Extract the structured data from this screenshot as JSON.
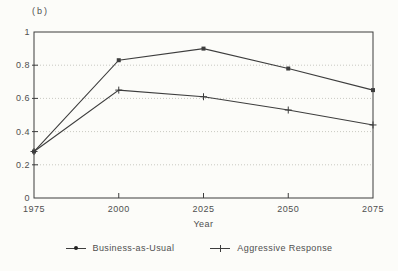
{
  "figure_label": "(b)",
  "chart_data": {
    "type": "line",
    "x": [
      1975,
      2000,
      2025,
      2050,
      2075
    ],
    "series": [
      {
        "name": "Business-as-Usual",
        "marker": "square",
        "values": [
          0.28,
          0.83,
          0.9,
          0.78,
          0.65
        ]
      },
      {
        "name": "Aggressive Response",
        "marker": "plus",
        "values": [
          0.28,
          0.65,
          0.61,
          0.53,
          0.44
        ]
      }
    ],
    "title": "",
    "xlabel": "Year",
    "ylabel": "",
    "xlim": [
      1975,
      2075
    ],
    "ylim": [
      0,
      1
    ],
    "xticks": [
      1975,
      2000,
      2025,
      2050,
      2075
    ],
    "yticks": [
      0,
      0.2,
      0.4,
      0.6,
      0.8,
      1
    ],
    "ytick_labels": [
      "0",
      "0.2",
      "0.4",
      "0.6",
      "0.8",
      "1"
    ],
    "grid": "horizontal dotted lines at 0.2, 0.4, 0.6, 0.8",
    "legend_position": "bottom-center",
    "line_color": "#3d3d3d",
    "grid_color": "#c9c9c2",
    "background_color": "#fcfcf9"
  }
}
